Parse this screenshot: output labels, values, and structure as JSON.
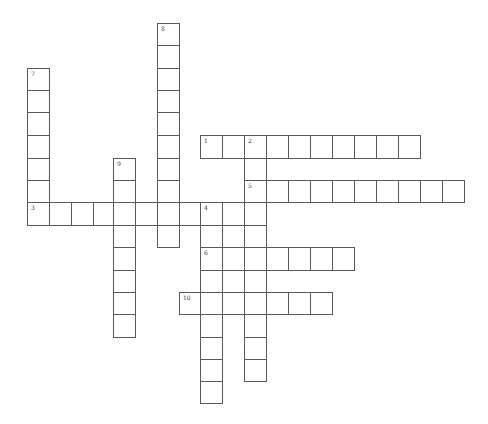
{
  "puzzle": {
    "type": "crossword",
    "cell_size": 22,
    "colors": {
      "border": "#5a5a5a",
      "background": "#ffffff",
      "number": "#333333"
    },
    "col_x": [
      27,
      49,
      71,
      93,
      113,
      135,
      157,
      179,
      200,
      222,
      244,
      266,
      288,
      310,
      332,
      354,
      376,
      398,
      420,
      442
    ],
    "row_y": [
      23,
      45,
      68,
      90,
      112,
      135,
      158,
      180,
      202,
      225,
      247,
      270,
      292,
      314,
      337,
      359,
      381
    ],
    "entries": [
      {
        "number": "1",
        "direction": "across",
        "row": 5,
        "col": 8,
        "length": 10
      },
      {
        "number": "2",
        "direction": "down",
        "row": 5,
        "col": 10,
        "length": 11
      },
      {
        "number": "3",
        "direction": "across",
        "row": 8,
        "col": 0,
        "length": 11
      },
      {
        "number": "4",
        "direction": "down",
        "row": 8,
        "col": 8,
        "length": 9
      },
      {
        "number": "5",
        "direction": "across",
        "row": 7,
        "col": 10,
        "length": 10
      },
      {
        "number": "6",
        "direction": "across",
        "row": 10,
        "col": 8,
        "length": 7
      },
      {
        "number": "7",
        "direction": "down",
        "row": 2,
        "col": 0,
        "length": 7
      },
      {
        "number": "8",
        "direction": "down",
        "row": 0,
        "col": 6,
        "length": 10
      },
      {
        "number": "9",
        "direction": "down",
        "row": 6,
        "col": 4,
        "length": 8
      },
      {
        "number": "10",
        "direction": "across",
        "row": 12,
        "col": 7,
        "length": 7
      },
      {
        "number": "",
        "direction": "down",
        "row": 8,
        "col": 9,
        "length": 5
      }
    ]
  }
}
